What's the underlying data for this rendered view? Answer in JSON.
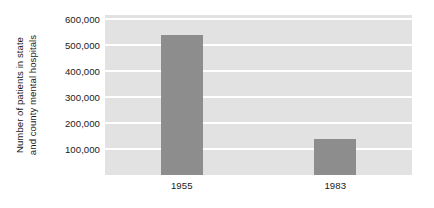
{
  "chart_data": {
    "type": "bar",
    "title": "",
    "subtitle": "",
    "xlabel": "",
    "ylabel_lines": [
      "Number of patients in state",
      "and county mental hospitals"
    ],
    "ylabel": "Number of patients in state and county mental hospitals",
    "categories": [
      "1955",
      "1983"
    ],
    "values": [
      540000,
      140000
    ],
    "series": [
      {
        "name": "Patients",
        "values": [
          540000,
          140000
        ]
      }
    ],
    "ytick_labels": [
      "600,000",
      "500,000",
      "400,000",
      "300,000",
      "200,000",
      "100,000"
    ],
    "ytick_values": [
      600000,
      500000,
      400000,
      300000,
      200000,
      100000
    ],
    "ylim": [
      0,
      615000
    ],
    "grid": true,
    "grid_axis": "y",
    "legend": false,
    "legend_position": "none",
    "annotations": []
  },
  "style": {
    "plot_background": "#e2e2e2",
    "bar_color": "#8d8d8d",
    "gridline_color": "#ffffff",
    "text_color": "#1a1a1a",
    "page_background": "#ffffff"
  }
}
